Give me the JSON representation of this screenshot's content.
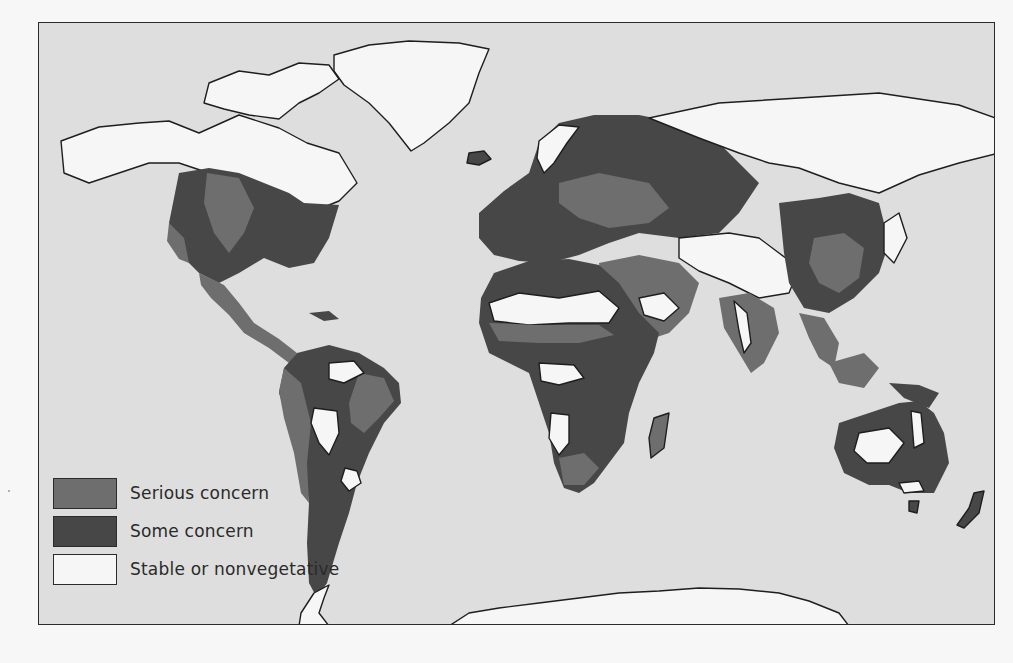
{
  "colors": {
    "ocean": "#dedede",
    "serious": "#6e6e6e",
    "some": "#474747",
    "stable": "#f6f6f6",
    "outline": "#1e1e1e"
  },
  "legend": {
    "items": [
      {
        "key": "serious",
        "label": "Serious concern",
        "color": "#6e6e6e"
      },
      {
        "key": "some",
        "label": "Some concern",
        "color": "#474747"
      },
      {
        "key": "stable",
        "label": "Stable or nonvegetative",
        "color": "#f6f6f6"
      }
    ]
  },
  "map": {
    "subject": "Global vegetation / land degradation concern",
    "regions": [
      {
        "name": "north-america-north",
        "class": "stable",
        "path": "M22 118 L60 104 L100 100 L130 98 L160 110 L200 92 L240 105 L268 120 L300 130 L318 160 L300 178 L280 186 L256 198 L230 200 L200 205 L170 150 L140 140 L110 140 L80 150 L50 160 L25 150 Z"
      },
      {
        "name": "canadian-archipelago",
        "class": "stable",
        "path": "M170 60 L200 48 L230 52 L260 40 L290 42 L300 56 L280 70 L260 80 L240 96 L210 92 L185 86 L165 80 Z"
      },
      {
        "name": "greenland",
        "class": "stable",
        "path": "M295 32 L330 22 L370 18 L420 20 L450 26 L440 50 L430 80 L410 100 L385 120 L372 128 L350 100 L330 80 L305 62 L295 48 Z"
      },
      {
        "name": "north-america-usa",
        "class": "some",
        "path": "M140 150 L170 145 L200 150 L225 160 L250 170 L265 180 L300 182 L290 215 L275 240 L250 245 L225 235 L200 250 L180 260 L160 250 L140 230 L130 200 Z"
      },
      {
        "name": "north-america-plains",
        "class": "serious",
        "path": "M168 150 L200 155 L215 185 L205 210 L190 230 L175 210 L165 180 Z"
      },
      {
        "name": "north-america-west",
        "class": "serious",
        "path": "M130 200 L145 215 L150 240 L140 236 L128 218 Z"
      },
      {
        "name": "mexico-central-america",
        "class": "serious",
        "path": "M160 250 L185 262 L200 280 L215 300 L240 316 L258 330 L250 340 L230 325 L205 310 L190 292 L172 275 L162 262 Z"
      },
      {
        "name": "caribbean",
        "class": "some",
        "path": "M270 290 L290 288 L300 296 L285 298 Z"
      },
      {
        "name": "south-america",
        "class": "some",
        "path": "M258 330 L290 322 L320 330 L345 345 L360 360 L362 380 L345 400 L330 430 L318 460 L310 490 L300 520 L288 560 L278 575 L270 560 L268 520 L270 480 L265 440 L250 400 L240 370 L245 345 Z"
      },
      {
        "name": "south-america-west",
        "class": "serious",
        "path": "M245 345 L262 360 L272 400 L268 440 L270 480 L262 470 L255 430 L245 395 L240 368 Z"
      },
      {
        "name": "south-america-east",
        "class": "serious",
        "path": "M320 350 L345 355 L355 378 L340 395 L325 410 L312 400 L310 380 Z"
      },
      {
        "name": "south-america-amazon-stable",
        "class": "stable",
        "path": "M290 340 L315 338 L325 350 L305 360 L290 356 Z"
      },
      {
        "name": "south-america-central-stable",
        "class": "stable",
        "path": "M275 385 L298 388 L300 410 L290 432 L280 420 L272 400 Z"
      },
      {
        "name": "south-america-south-stable",
        "class": "stable",
        "path": "M306 445 L318 448 L322 460 L310 468 L302 458 Z"
      },
      {
        "name": "iceland",
        "class": "some",
        "path": "M430 130 L445 128 L452 136 L440 142 L428 140 Z"
      },
      {
        "name": "europe",
        "class": "some",
        "path": "M440 190 L465 168 L490 150 L500 120 L520 100 L555 92 L600 92 L640 100 L660 110 L680 120 L700 140 L720 160 L700 190 L680 210 L640 215 L600 210 L570 220 L540 232 L510 240 L480 238 L455 232 L440 215 Z"
      },
      {
        "name": "europe-central-serious",
        "class": "serious",
        "path": "M520 160 L560 150 L610 160 L630 185 L610 200 L570 205 L540 195 L520 180 Z"
      },
      {
        "name": "scandinavia-stable",
        "class": "stable",
        "path": "M500 118 L520 102 L540 104 L528 120 L515 140 L505 150 L498 135 Z"
      },
      {
        "name": "uk",
        "class": "some",
        "path": "M478 172 L488 168 L494 190 L480 195 Z"
      },
      {
        "name": "russia-north-stable",
        "class": "stable",
        "path": "M610 95 L680 80 L760 75 L840 70 L920 82 L970 100 L960 130 L920 140 L880 152 L840 170 L800 160 L760 145 L730 140 L700 130 L660 115 Z"
      },
      {
        "name": "central-asia-stable",
        "class": "stable",
        "path": "M640 215 L690 210 L720 215 L740 230 L760 245 L750 270 L720 275 L690 260 L660 248 L640 235 Z"
      },
      {
        "name": "middle-east",
        "class": "serious",
        "path": "M560 240 L600 232 L640 240 L660 260 L650 290 L630 310 L600 320 L580 300 L565 275 Z"
      },
      {
        "name": "arabia-stable",
        "class": "stable",
        "path": "M600 275 L625 270 L640 285 L625 298 L605 292 Z"
      },
      {
        "name": "india",
        "class": "serious",
        "path": "M680 275 L710 270 L735 285 L740 310 L725 340 L712 350 L700 330 L685 305 Z"
      },
      {
        "name": "india-stable",
        "class": "stable",
        "path": "M695 278 L708 290 L712 320 L705 330 L700 308 Z"
      },
      {
        "name": "china-east",
        "class": "some",
        "path": "M740 180 L780 175 L810 170 L840 180 L850 220 L840 250 L815 275 L790 290 L765 285 L750 260 L745 230 Z"
      },
      {
        "name": "china-south-serious",
        "class": "serious",
        "path": "M775 215 L805 210 L825 225 L820 255 L800 270 L780 260 L770 240 Z"
      },
      {
        "name": "southeast-asia",
        "class": "serious",
        "path": "M760 290 L785 295 L800 320 L795 345 L780 335 L770 315 Z"
      },
      {
        "name": "indonesia",
        "class": "serious",
        "path": "M790 340 L825 330 L840 345 L825 365 L800 360 Z"
      },
      {
        "name": "new-guinea",
        "class": "some",
        "path": "M850 360 L880 362 L900 370 L890 385 L865 375 Z"
      },
      {
        "name": "japan",
        "class": "stable",
        "path": "M845 200 L860 190 L868 215 L855 240 L845 230 Z"
      },
      {
        "name": "africa",
        "class": "some",
        "path": "M455 250 L490 238 L530 236 L560 242 L580 260 L600 290 L620 310 L615 330 L600 360 L590 390 L585 420 L570 440 L555 460 L540 470 L525 465 L515 440 L510 410 L500 380 L490 350 L470 340 L450 330 L440 300 L442 275 Z"
      },
      {
        "name": "sahara-stable",
        "class": "stable",
        "path": "M450 280 L480 270 L520 275 L560 268 L580 285 L570 300 L530 300 L490 302 L455 298 Z"
      },
      {
        "name": "sahel-serious",
        "class": "serious",
        "path": "M450 300 L500 302 L560 302 L575 312 L540 320 L500 320 L460 318 Z"
      },
      {
        "name": "congo-stable",
        "class": "stable",
        "path": "M500 340 L535 342 L545 355 L520 362 L502 358 Z"
      },
      {
        "name": "southern-africa-stable",
        "class": "stable",
        "path": "M512 390 L530 392 L530 420 L520 432 L510 415 Z"
      },
      {
        "name": "southern-africa-serious",
        "class": "serious",
        "path": "M520 435 L545 430 L560 445 L545 462 L525 462 Z"
      },
      {
        "name": "madagascar",
        "class": "serious",
        "path": "M615 395 L630 390 L625 425 L612 435 L610 415 Z"
      },
      {
        "name": "australia",
        "class": "some",
        "path": "M800 400 L830 390 L860 380 L880 378 L895 390 L905 410 L910 440 L895 470 L870 470 L850 462 L830 462 L805 450 L795 425 Z"
      },
      {
        "name": "australia-west-stable",
        "class": "stable",
        "path": "M820 410 L850 405 L865 420 L850 440 L828 440 L815 428 Z"
      },
      {
        "name": "australia-east-stable",
        "class": "stable",
        "path": "M872 388 L882 390 L885 420 L875 425 Z"
      },
      {
        "name": "australia-south-stable",
        "class": "stable",
        "path": "M860 460 L880 458 L885 468 L865 470 Z"
      },
      {
        "name": "tasmania",
        "class": "some",
        "path": "M870 478 L880 478 L878 490 L870 488 Z"
      },
      {
        "name": "new-zealand",
        "class": "some",
        "path": "M935 470 L945 468 L940 490 L925 505 L918 502 L930 485 Z"
      },
      {
        "name": "antarctica-east",
        "class": "stable",
        "path": "M410 603 L430 590 L460 585 L500 580 L540 575 L580 570 L620 568 L660 565 L700 566 L740 570 L770 578 L800 590 L810 603 Z"
      },
      {
        "name": "antarctica-peninsula",
        "class": "stable",
        "path": "M260 603 L262 590 L275 570 L290 562 L285 575 L280 590 L290 603 Z"
      }
    ]
  }
}
